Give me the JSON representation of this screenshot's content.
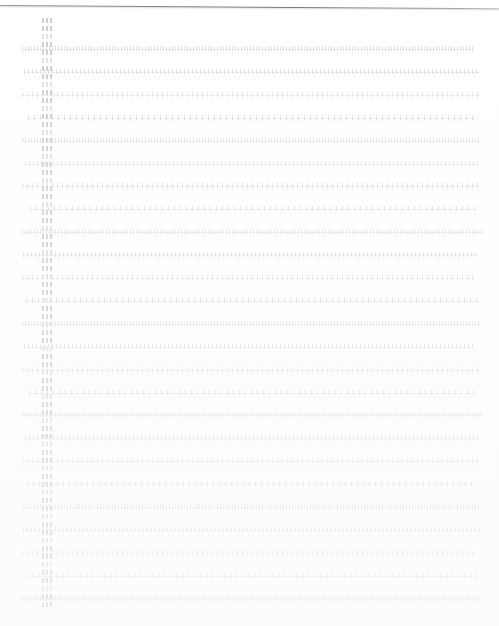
{
  "document": {
    "kind": "scanned-page",
    "title": "Faded scanned manuscript page",
    "background_color": "#ffffff",
    "page_edge": {
      "name": "top-page-edge",
      "color": "#7d7d7d",
      "y": 5,
      "slant_degrees": 0.38
    },
    "ink_color": "#cecece",
    "baseline_color": "#e9e9ec",
    "margin_column": {
      "name": "left-margin-ruling",
      "x": 42,
      "width": 11,
      "top": 18,
      "mark_count": 74,
      "mark_spacing": 8,
      "color": "#c4c4cb"
    },
    "text_block": {
      "left": 22,
      "right": 482,
      "first_baseline_y": 50,
      "line_spacing": 22.9,
      "line_count": 25,
      "lines": [
        {
          "index": 1,
          "indent": 0,
          "width": 452,
          "density": 0.52
        },
        {
          "index": 2,
          "indent": 2,
          "width": 456,
          "density": 0.61
        },
        {
          "index": 3,
          "indent": 0,
          "width": 458,
          "density": 0.47
        },
        {
          "index": 4,
          "indent": 6,
          "width": 450,
          "density": 0.66
        },
        {
          "index": 5,
          "indent": 0,
          "width": 459,
          "density": 0.55
        },
        {
          "index": 6,
          "indent": 3,
          "width": 454,
          "density": 0.49
        },
        {
          "index": 7,
          "indent": 0,
          "width": 457,
          "density": 0.7
        },
        {
          "index": 8,
          "indent": 8,
          "width": 448,
          "density": 0.58
        },
        {
          "index": 9,
          "indent": 0,
          "width": 460,
          "density": 0.44
        },
        {
          "index": 10,
          "indent": 1,
          "width": 455,
          "density": 0.63
        },
        {
          "index": 11,
          "indent": 0,
          "width": 452,
          "density": 0.51
        },
        {
          "index": 12,
          "indent": 4,
          "width": 456,
          "density": 0.68
        },
        {
          "index": 13,
          "indent": 0,
          "width": 459,
          "density": 0.46
        },
        {
          "index": 14,
          "indent": 2,
          "width": 451,
          "density": 0.6
        },
        {
          "index": 15,
          "indent": 0,
          "width": 458,
          "density": 0.54
        },
        {
          "index": 16,
          "indent": 7,
          "width": 447,
          "density": 0.72
        },
        {
          "index": 17,
          "indent": 0,
          "width": 460,
          "density": 0.48
        },
        {
          "index": 18,
          "indent": 3,
          "width": 453,
          "density": 0.64
        },
        {
          "index": 19,
          "indent": 0,
          "width": 456,
          "density": 0.5
        },
        {
          "index": 20,
          "indent": 5,
          "width": 449,
          "density": 0.67
        },
        {
          "index": 21,
          "indent": 0,
          "width": 459,
          "density": 0.45
        },
        {
          "index": 22,
          "indent": 1,
          "width": 457,
          "density": 0.62
        },
        {
          "index": 23,
          "indent": 0,
          "width": 454,
          "density": 0.56
        },
        {
          "index": 24,
          "indent": 4,
          "width": 452,
          "density": 0.71
        },
        {
          "index": 25,
          "indent": 0,
          "width": 458,
          "density": 0.69
        }
      ]
    }
  }
}
